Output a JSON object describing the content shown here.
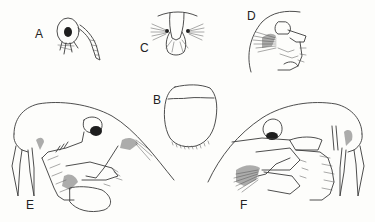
{
  "figure": {
    "background_color": "#fdfdfb",
    "line_color": "#3a3a3a",
    "panels": [
      {
        "label": "A",
        "subject": "early larva, lateral view, small"
      },
      {
        "label": "B",
        "subject": "carapace outline, dorsal view"
      },
      {
        "label": "C",
        "subject": "larva, frontal/ventral view with setose appendages"
      },
      {
        "label": "D",
        "subject": "larva, lateral view with long rostrum"
      },
      {
        "label": "E",
        "subject": "late larva, lateral view, long curved rostrum and spines"
      },
      {
        "label": "F",
        "subject": "late larva, lateral view, mirrored, with setose fan"
      }
    ]
  }
}
